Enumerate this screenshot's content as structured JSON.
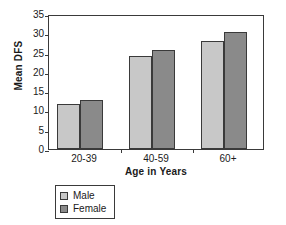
{
  "chart_data": {
    "type": "bar",
    "title": "",
    "xlabel": "Age in Years",
    "ylabel": "Mean DFS",
    "categories": [
      "20-39",
      "40-59",
      "60+"
    ],
    "series": [
      {
        "name": "Male",
        "values": [
          11.7,
          24.0,
          28.0
        ],
        "color": "#c8c8c8"
      },
      {
        "name": "Female",
        "values": [
          12.6,
          25.6,
          30.4
        ],
        "color": "#8a8a8a"
      }
    ],
    "ylim": [
      0,
      35
    ],
    "ytick_labels": [
      "0",
      "5",
      "10",
      "15",
      "20",
      "25",
      "30",
      "35"
    ],
    "ytick_values": [
      0,
      5,
      10,
      15,
      20,
      25,
      30,
      35
    ],
    "grid": false,
    "legend_position": "bottom-left",
    "axis_color": "#3a3a3a",
    "background_color": "#ffffff"
  }
}
